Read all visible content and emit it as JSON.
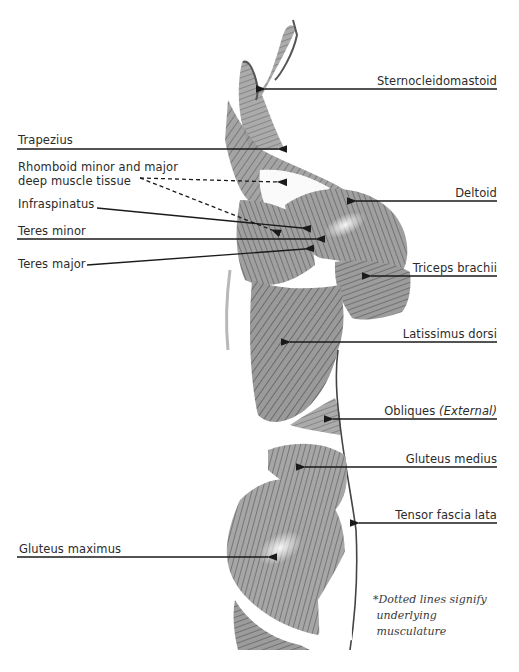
{
  "figure": {
    "view": "posterior-lateral, right side"
  },
  "labels_left": [
    {
      "id": "trapezius",
      "text": "Trapezius",
      "line": "solid"
    },
    {
      "id": "rhomboid",
      "text_line1": "Rhomboid minor and major",
      "text_line2": "deep muscle tissue",
      "line": "dotted"
    },
    {
      "id": "infraspinatus",
      "text": "Infraspinatus",
      "line": "solid"
    },
    {
      "id": "teres-minor",
      "text": "Teres minor",
      "line": "solid"
    },
    {
      "id": "teres-major",
      "text": "Teres major",
      "line": "solid"
    },
    {
      "id": "gluteus-maximus",
      "text": "Gluteus maximus",
      "line": "solid"
    }
  ],
  "labels_right": [
    {
      "id": "sternocleidomastoid",
      "text": "Sternocleidomastoid",
      "line": "solid"
    },
    {
      "id": "deltoid",
      "text": "Deltoid",
      "line": "solid"
    },
    {
      "id": "triceps-brachii",
      "text": "Triceps brachii",
      "line": "solid"
    },
    {
      "id": "latissimus-dorsi",
      "text": "Latissimus dorsi",
      "line": "solid"
    },
    {
      "id": "obliques",
      "text": "Obliques",
      "qualifier": "(External)",
      "line": "solid"
    },
    {
      "id": "gluteus-medius",
      "text": "Gluteus medius",
      "line": "solid"
    },
    {
      "id": "tensor-fascia-lata",
      "text": "Tensor fascia lata",
      "line": "solid"
    }
  ],
  "footnote": {
    "line1": "*Dotted lines signify",
    "line2": " underlying",
    "line3": " musculature"
  },
  "colors": {
    "background": "#ffffff",
    "text": "#2b2b2b",
    "leader_line": "#1a1a1a",
    "muscle_dark": "#5a5a5a",
    "muscle_mid": "#8c8c8c",
    "muscle_light": "#bdbdbd"
  }
}
